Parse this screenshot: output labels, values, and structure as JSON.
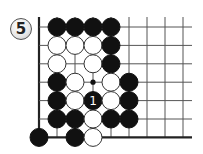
{
  "problem": {
    "number_label": "5"
  },
  "board": {
    "origin_x": 39,
    "origin_y": 27,
    "spacing_x": 18.0,
    "spacing_y": 18.4,
    "cols": 9,
    "rows": 7,
    "stone_radius": 9,
    "line_color": "#555555",
    "edge_color": "#222222",
    "black_color": "#111111",
    "white_color": "#ffffff",
    "edges": [
      "left",
      "bottom"
    ],
    "star_points": [
      {
        "col": 3,
        "row": 3
      }
    ],
    "stones": [
      {
        "col": 1,
        "row": 0,
        "color": "black"
      },
      {
        "col": 2,
        "row": 0,
        "color": "black"
      },
      {
        "col": 3,
        "row": 0,
        "color": "black"
      },
      {
        "col": 4,
        "row": 0,
        "color": "black"
      },
      {
        "col": 1,
        "row": 1,
        "color": "white"
      },
      {
        "col": 2,
        "row": 1,
        "color": "white"
      },
      {
        "col": 3,
        "row": 1,
        "color": "white"
      },
      {
        "col": 4,
        "row": 1,
        "color": "black"
      },
      {
        "col": 1,
        "row": 2,
        "color": "white"
      },
      {
        "col": 3,
        "row": 2,
        "color": "white"
      },
      {
        "col": 4,
        "row": 2,
        "color": "black"
      },
      {
        "col": 1,
        "row": 3,
        "color": "black"
      },
      {
        "col": 2,
        "row": 3,
        "color": "white"
      },
      {
        "col": 4,
        "row": 3,
        "color": "white"
      },
      {
        "col": 5,
        "row": 3,
        "color": "black"
      },
      {
        "col": 1,
        "row": 4,
        "color": "black"
      },
      {
        "col": 2,
        "row": 4,
        "color": "white"
      },
      {
        "col": 3,
        "row": 4,
        "color": "black",
        "label": "1"
      },
      {
        "col": 4,
        "row": 4,
        "color": "white"
      },
      {
        "col": 5,
        "row": 4,
        "color": "black"
      },
      {
        "col": 1,
        "row": 5,
        "color": "black"
      },
      {
        "col": 2,
        "row": 5,
        "color": "black"
      },
      {
        "col": 3,
        "row": 5,
        "color": "white"
      },
      {
        "col": 4,
        "row": 5,
        "color": "black"
      },
      {
        "col": 5,
        "row": 5,
        "color": "black"
      },
      {
        "col": 0,
        "row": 6,
        "color": "black"
      },
      {
        "col": 2,
        "row": 6,
        "color": "black"
      },
      {
        "col": 3,
        "row": 6,
        "color": "white"
      }
    ]
  }
}
